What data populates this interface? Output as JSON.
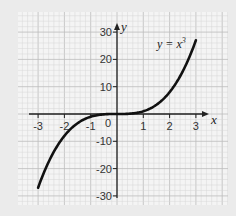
{
  "chart_data": {
    "type": "line",
    "title": "",
    "xlabel": "x",
    "ylabel": "y",
    "xlim": [
      -3,
      3
    ],
    "ylim": [
      -30,
      30
    ],
    "grid": true,
    "x_ticks": [
      -3,
      -2,
      -1,
      0,
      1,
      2,
      3
    ],
    "x_tick_labels": [
      "-3",
      "-2",
      "-1",
      "0",
      "1",
      "2",
      "3"
    ],
    "y_ticks": [
      30,
      20,
      10,
      -10,
      -20,
      -30
    ],
    "y_tick_labels": [
      "30",
      "20",
      "10",
      "-10",
      "-20",
      "-30"
    ],
    "series": [
      {
        "name": "y = x³",
        "x": [
          -3,
          -2.5,
          -2,
          -1.5,
          -1,
          -0.5,
          0,
          0.5,
          1,
          1.5,
          2,
          2.5,
          3
        ],
        "values": [
          -27,
          -15.6,
          -8,
          -3.4,
          -1,
          -0.1,
          0,
          0.1,
          1,
          3.4,
          8,
          15.6,
          27
        ]
      }
    ],
    "annotations": [
      {
        "text": "y = x³",
        "x": 1.5,
        "y": 25
      }
    ],
    "colors": {
      "background": "#ebebeb",
      "grid_panel": "#f4f4f4",
      "grid_minor": "#d6d6d6",
      "grid_major": "#bdbdbd",
      "axis": "#222222",
      "curve": "#111111"
    }
  },
  "labels": {
    "x_axis": "x",
    "y_axis": "y",
    "curve": "y = x",
    "curve_exp": "3",
    "origin": "0"
  }
}
